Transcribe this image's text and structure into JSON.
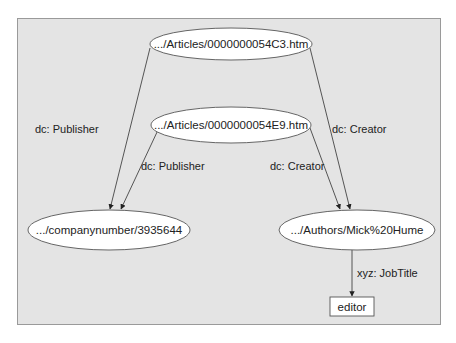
{
  "diagram": {
    "background": "#e4e4e4",
    "nodes": [
      {
        "id": "article1",
        "shape": "ellipse",
        "label": ".../Articles/0000000054C3.htm"
      },
      {
        "id": "article2",
        "shape": "ellipse",
        "label": ".../Articles/0000000054E9.htm"
      },
      {
        "id": "company",
        "shape": "ellipse",
        "label": ".../companynumber/3935644"
      },
      {
        "id": "author",
        "shape": "ellipse",
        "label": ".../Authors/Mick%20Hume"
      },
      {
        "id": "editor",
        "shape": "rect",
        "label": "editor"
      }
    ],
    "edges": [
      {
        "from": "article1",
        "to": "company",
        "label": "dc: Publisher"
      },
      {
        "from": "article1",
        "to": "author",
        "label": "dc: Creator"
      },
      {
        "from": "article2",
        "to": "company",
        "label": "dc: Publisher"
      },
      {
        "from": "article2",
        "to": "author",
        "label": "dc: Creator"
      },
      {
        "from": "author",
        "to": "editor",
        "label": "xyz: JobTitle"
      }
    ]
  }
}
